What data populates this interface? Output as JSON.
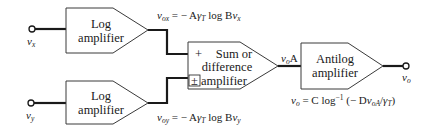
{
  "diagram": {
    "blocks": {
      "log_top": {
        "line1": "Log",
        "line2": "amplifier"
      },
      "log_bottom": {
        "line1": "Log",
        "line2": "amplifier"
      },
      "sum": {
        "line1": "Sum or",
        "line2": "difference",
        "line3": "amplifier",
        "plus_sign": "+",
        "pm_sign": "±"
      },
      "antilog": {
        "line1": "Antilog",
        "line2": "amplifier"
      }
    },
    "terminals": {
      "input_x": {
        "var": "v",
        "sub": "x"
      },
      "input_y": {
        "var": "v",
        "sub": "y"
      },
      "output": {
        "var": "v",
        "sub": "o"
      }
    },
    "signals": {
      "vox": {
        "lhs_var": "v",
        "lhs_sub": "ox",
        "rhs_pre": " = − A",
        "gamma": "γ",
        "gamma_sub": "T",
        "rhs_post": " log B",
        "rhs_var": "v",
        "rhs_sub": "x"
      },
      "voy": {
        "lhs_var": "v",
        "lhs_sub": "oy",
        "rhs_pre": " = − A",
        "gamma": "γ",
        "gamma_sub": "T",
        "rhs_post": " log B",
        "rhs_var": "v",
        "rhs_sub": "y"
      },
      "voA": {
        "var": "v",
        "sub": "o",
        "suffix": "A"
      },
      "vo_eq": {
        "lhs_var": "v",
        "lhs_sub": "o",
        "mid": " = C log",
        "exp": "−1",
        "open": " (− D",
        "arg_var": "v",
        "arg_sub": "oA",
        "slash": "/",
        "gamma": "γ",
        "gamma_sub": "T",
        "close": ")"
      }
    },
    "colors": {
      "stroke": "#1a1a1a",
      "block_border": "#3a3a3a",
      "background": "#ffffff"
    }
  }
}
